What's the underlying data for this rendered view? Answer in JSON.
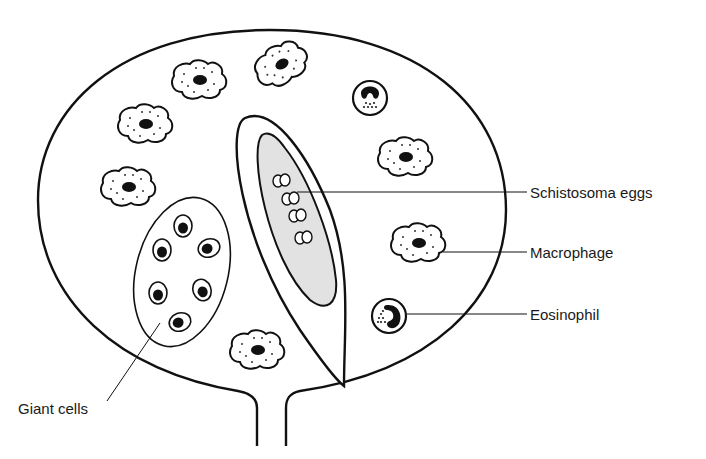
{
  "figure": {
    "type": "schematic diagram",
    "labels": {
      "eggs": "Schistosoma eggs",
      "macrophage": "Macrophage",
      "eosinophil": "Eosinophil",
      "giant_cells": "Giant cells"
    },
    "colors": {
      "line": "#111111",
      "egg_sac_fill": "#e2e2e2",
      "background": "#ffffff"
    }
  }
}
